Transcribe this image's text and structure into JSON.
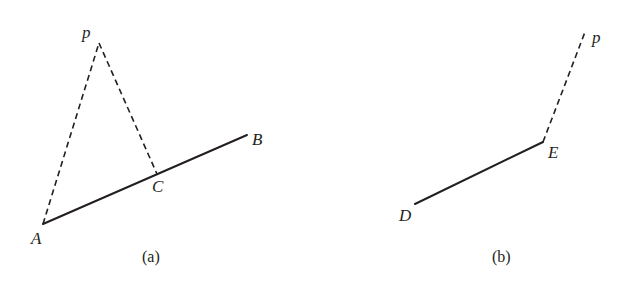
{
  "figure": {
    "background_color": "#ffffff",
    "stroke_color": "#231f20",
    "label_color": "#231f20",
    "solid_stroke_width": 2,
    "dashed_stroke_width": 1.6,
    "dash_pattern": "6,4",
    "panels": [
      {
        "id": "panel-a",
        "caption": "(a)",
        "caption_pos": {
          "x": 142,
          "y": 249
        },
        "points": [
          {
            "name": "A",
            "label": "A",
            "x": 43,
            "y": 224,
            "label_x": 31,
            "label_y": 230
          },
          {
            "name": "B",
            "label": "B",
            "x": 247,
            "y": 135,
            "label_x": 252,
            "label_y": 131
          },
          {
            "name": "C",
            "label": "C",
            "x": 157,
            "y": 174,
            "label_x": 152,
            "label_y": 178
          },
          {
            "name": "P",
            "label": "p",
            "x": 99,
            "y": 43,
            "label_x": 82,
            "label_y": 24
          }
        ],
        "segments": [
          {
            "name": "segment-AB",
            "from": "A",
            "to": "B",
            "style": "solid"
          },
          {
            "name": "segment-AP",
            "from": "A",
            "to": "P",
            "style": "dashed"
          },
          {
            "name": "segment-PC",
            "from": "P",
            "to": "C",
            "style": "dashed"
          }
        ]
      },
      {
        "id": "panel-b",
        "caption": "(b)",
        "caption_pos": {
          "x": 492,
          "y": 249
        },
        "points": [
          {
            "name": "D",
            "label": "D",
            "x": 415,
            "y": 204,
            "label_x": 399,
            "label_y": 207
          },
          {
            "name": "E",
            "label": "E",
            "x": 543,
            "y": 142,
            "label_x": 548,
            "label_y": 144
          },
          {
            "name": "P",
            "label": "p",
            "x": 585,
            "y": 32,
            "label_x": 592,
            "label_y": 29
          }
        ],
        "segments": [
          {
            "name": "segment-DE",
            "from": "D",
            "to": "E",
            "style": "solid"
          },
          {
            "name": "segment-EP",
            "from": "E",
            "to": "P",
            "style": "dashed"
          }
        ]
      }
    ]
  },
  "chart_data": {
    "type": "diagram",
    "title": "",
    "panel_a": {
      "caption": "(a)",
      "vertices": {
        "A": [
          43,
          224
        ],
        "B": [
          247,
          135
        ],
        "C": [
          157,
          174
        ],
        "p": [
          99,
          43
        ]
      },
      "solid_segments": [
        [
          "A",
          "B"
        ]
      ],
      "dashed_segments": [
        [
          "A",
          "p"
        ],
        [
          "p",
          "C"
        ]
      ],
      "labels": [
        "p",
        "B",
        "C",
        "A"
      ]
    },
    "panel_b": {
      "caption": "(b)",
      "vertices": {
        "D": [
          415,
          204
        ],
        "E": [
          543,
          142
        ],
        "p": [
          585,
          32
        ]
      },
      "solid_segments": [
        [
          "D",
          "E"
        ]
      ],
      "dashed_segments": [
        [
          "E",
          "p"
        ]
      ],
      "labels": [
        "p",
        "E",
        "D"
      ]
    }
  }
}
